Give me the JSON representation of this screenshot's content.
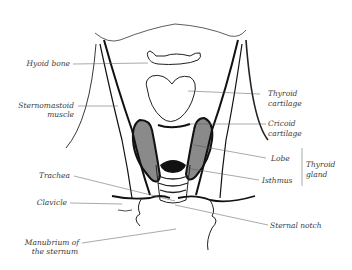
{
  "figure": {
    "type": "anatomical line drawing"
  },
  "labels_left": {
    "hyoid_bone": "Hyoid bone",
    "sternomastoid_1": "Sternomastoid",
    "sternomastoid_2": "muscle",
    "trachea": "Trachea",
    "clavicle": "Clavicle",
    "manubrium_1": "Manubrium of",
    "manubrium_2": "the sternum"
  },
  "labels_right": {
    "thyroid_cartilage_1": "Thyroid",
    "thyroid_cartilage_2": "cartilage",
    "cricoid_cartilage_1": "Cricoid",
    "cricoid_cartilage_2": "cartilage",
    "lobe": "Lobe",
    "isthmus": "Isthmus",
    "thyroid_gland_1": "Thyroid",
    "thyroid_gland_2": "gland",
    "sternal_notch": "Sternal notch"
  },
  "colors": {
    "ink": "#1a1a1a",
    "leader": "#555555",
    "label": "#3a3a3a",
    "background": "#ffffff"
  }
}
